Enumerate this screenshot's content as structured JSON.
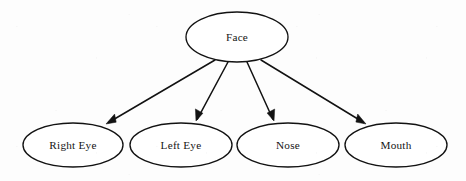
{
  "diagram": {
    "type": "tree",
    "background_color": "#ffffff",
    "stroke_color": "#121212",
    "text_color": "#141414",
    "node_shape": "ellipse",
    "root": {
      "id": "face",
      "label": "Face",
      "cx": 237,
      "cy": 37,
      "rx": 51,
      "ry": 25
    },
    "children": [
      {
        "id": "right-eye",
        "label": "Right Eye",
        "cx": 73,
        "cy": 145,
        "rx": 50,
        "ry": 22
      },
      {
        "id": "left-eye",
        "label": "Left Eye",
        "cx": 181,
        "cy": 145,
        "rx": 51,
        "ry": 22
      },
      {
        "id": "nose",
        "label": "Nose",
        "cx": 288,
        "cy": 145,
        "rx": 51,
        "ry": 22
      },
      {
        "id": "mouth",
        "label": "Mouth",
        "cx": 396,
        "cy": 145,
        "rx": 51,
        "ry": 22
      }
    ],
    "edges": [
      {
        "id": "edge-face-right-eye",
        "from": "face",
        "to": "right-eye",
        "label": "",
        "arrowhead": "filled-triangle",
        "x1": 215,
        "y1": 60,
        "x2": 106,
        "y2": 124
      },
      {
        "id": "edge-face-left-eye",
        "from": "face",
        "to": "left-eye",
        "label": "",
        "arrowhead": "filled-triangle",
        "x1": 228,
        "y1": 62,
        "x2": 196,
        "y2": 121
      },
      {
        "id": "edge-face-nose",
        "from": "face",
        "to": "nose",
        "label": "",
        "arrowhead": "filled-triangle",
        "x1": 247,
        "y1": 62,
        "x2": 274,
        "y2": 121
      },
      {
        "id": "edge-face-mouth",
        "from": "face",
        "to": "mouth",
        "label": "",
        "arrowhead": "filled-triangle",
        "x1": 261,
        "y1": 60,
        "x2": 366,
        "y2": 124
      }
    ]
  }
}
